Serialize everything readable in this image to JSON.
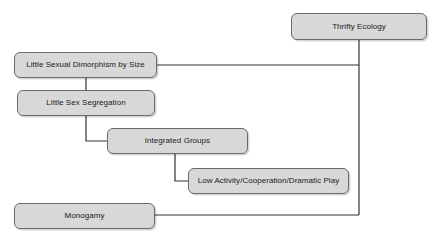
{
  "diagram": {
    "type": "flow-diagram",
    "title": "Thrifty Ecology",
    "canvas": {
      "width": 441,
      "height": 240,
      "background": "#ffffff"
    },
    "style": {
      "node_fill": "#d8d8d8",
      "node_border": "#6b6b6b",
      "text_color": "#1a1a1a",
      "connector_color": "#333333"
    },
    "nodes": [
      {
        "id": "thrifty-ecology",
        "label": "Thrifty Ecology",
        "x": 291,
        "y": 13,
        "width": 136,
        "height": 27
      },
      {
        "id": "little-dimorphism",
        "label": "Little Sexual Dimorphism by Size",
        "x": 14,
        "y": 52,
        "width": 143,
        "height": 26
      },
      {
        "id": "sex-segregation",
        "label": "Little Sex Segregation",
        "x": 17,
        "y": 90,
        "width": 138,
        "height": 26
      },
      {
        "id": "integrated-groups",
        "label": "Integrated Groups",
        "x": 107,
        "y": 128,
        "width": 141,
        "height": 26
      },
      {
        "id": "low-activity",
        "label": "Low Activity/Cooperation/Dramatic Play",
        "x": 188,
        "y": 168,
        "width": 161,
        "height": 26
      },
      {
        "id": "monogamy",
        "label": "Monogamy",
        "x": 14,
        "y": 203,
        "width": 141,
        "height": 26
      }
    ],
    "connectors": [
      {
        "id": "trunk-thrifty-ecology",
        "from": "thrifty-ecology",
        "to": "trunk",
        "points": "359,40 359,215"
      },
      {
        "id": "little-dimorphism-to-trunk",
        "from": "little-dimorphism",
        "to": "thrifty-ecology",
        "points": "157,65 359,65"
      },
      {
        "id": "little-dimorphism-to-sex-segregation",
        "from": "little-dimorphism",
        "to": "sex-segregation",
        "points": "86,78 86,90"
      },
      {
        "id": "sex-segregation-to-integrated-groups",
        "from": "sex-segregation",
        "to": "integrated-groups",
        "points": "86,116 86,141 107,141"
      },
      {
        "id": "integrated-groups-to-low-activity",
        "from": "integrated-groups",
        "to": "low-activity",
        "points": "175,154 175,181 188,181"
      },
      {
        "id": "monogamy-to-trunk",
        "from": "monogamy",
        "to": "thrifty-ecology",
        "points": "155,215 359,215"
      }
    ]
  }
}
